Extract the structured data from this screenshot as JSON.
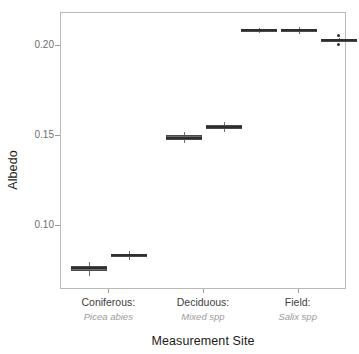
{
  "chart_data": {
    "type": "box",
    "title": "",
    "xlabel": "Measurement Site",
    "ylabel": "Albedo",
    "ylim": [
      0.065,
      0.2175
    ],
    "yticks": [
      0.1,
      0.15,
      0.2
    ],
    "ytick_labels": [
      "0.10",
      "0.15",
      "0.20"
    ],
    "grid": false,
    "legend": "none",
    "categories": [
      {
        "label": "Coniferous:",
        "sublabel": "Picea abies"
      },
      {
        "label": "Deciduous:",
        "sublabel": "Mixed spp"
      },
      {
        "label": "Field:",
        "sublabel": "Salix spp"
      }
    ],
    "boxes": [
      {
        "group": "Coniferous:",
        "index": 0,
        "q1": 0.0748,
        "median": 0.0765,
        "q3": 0.078,
        "whisker_low": 0.0722,
        "whisker_high": 0.08,
        "outliers": []
      },
      {
        "group": "Coniferous:",
        "index": 1,
        "q1": 0.0826,
        "median": 0.0836,
        "q3": 0.0846,
        "whisker_low": 0.0812,
        "whisker_high": 0.0858,
        "outliers": []
      },
      {
        "group": "Deciduous:",
        "index": 0,
        "q1": 0.1477,
        "median": 0.149,
        "q3": 0.1506,
        "whisker_low": 0.1462,
        "whisker_high": 0.1522,
        "outliers": []
      },
      {
        "group": "Deciduous:",
        "index": 1,
        "q1": 0.1536,
        "median": 0.1547,
        "q3": 0.156,
        "whisker_low": 0.1518,
        "whisker_high": 0.1575,
        "outliers": []
      },
      {
        "group": "Field:",
        "index": 0,
        "q1": 0.208,
        "median": 0.2086,
        "q3": 0.2092,
        "whisker_low": 0.207,
        "whisker_high": 0.21,
        "outliers": []
      },
      {
        "group": "Field:",
        "index": 1,
        "q1": 0.2078,
        "median": 0.2086,
        "q3": 0.2094,
        "whisker_low": 0.2066,
        "whisker_high": 0.2102,
        "outliers": []
      },
      {
        "group": "Field:",
        "index": 2,
        "q1": 0.2026,
        "median": 0.2031,
        "q3": 0.2036,
        "whisker_low": 0.2018,
        "whisker_high": 0.2044,
        "outliers": [
          0.2058,
          0.2004
        ]
      }
    ]
  },
  "style": {
    "box_fill": "#6d6d6d",
    "box_stroke": "#4a4a4a",
    "median_color": "#2e2e2e",
    "panel_border": "#b9b9b9",
    "tick_color": "#9a9a9a",
    "axis_text": "#1a1a1a",
    "tick_text": "#6e6e6e",
    "sublabel_text": "#9b9b9b"
  }
}
